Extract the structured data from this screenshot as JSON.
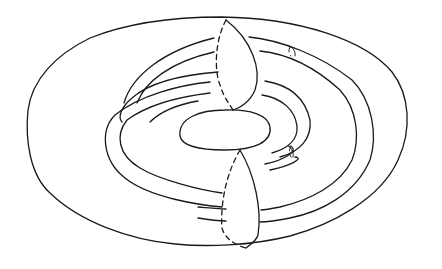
{
  "figure": {
    "title": "",
    "caption": "",
    "stroke_color": "#1a1a1a",
    "background": "#ffffff",
    "elements": {
      "outer_torus": "M 221 17 C 300 18 365 40 392 72 C 410 95 412 130 398 160 C 380 200 330 225 290 236 C 250 246 205 247 175 244 C 130 240 80 222 50 193 C 30 175 25 140 28 110 C 32 80 55 55 90 38 C 125 24 170 17 221 17 Z",
      "inner_hole": "M 180 136 C 178 118 200 110 225 110 C 250 109 268 115 270 127 C 272 142 255 150 225 150 C 200 150 182 146 180 136 Z",
      "meridian_top_front": "M 226 20 C 252 40 262 70 255 90 C 250 102 240 108 233 110",
      "meridian_top_back": "M 226 20 C 215 40 214 70 220 85 C 224 98 230 105 233 110",
      "meridian_bottom_front": "M 240 150 C 255 175 262 210 258 235 C 257 240 250 245 246 248",
      "meridian_bottom_back": "M 240 150 C 228 170 220 200 222 228 C 225 240 238 246 246 248",
      "tube_outer_a": "M 124 103 C 132 75 165 50 214 38 M 249 37 C 280 40 320 55 352 80 C 372 100 378 135 370 160 C 355 195 320 212 290 218 C 275 221 265 222 260 222",
      "tube_outer_b": "M 137 103 C 145 82 170 62 214 52 M 260 51 C 290 54 318 70 340 90 C 358 110 360 140 352 160 C 340 185 310 200 280 207 C 270 209 265 210 261 210",
      "tube_inner_a": "M 210 82 C 180 85 140 95 115 115 C 100 130 102 160 125 178 C 150 198 200 205 222 207",
      "tube_inner_b": "M 210 93 C 185 96 150 103 127 120 C 115 135 118 155 140 168 C 160 180 200 190 222 193",
      "tube_mid_left_a": "M 218 72 C 180 75 150 82 132 98 C 120 108 118 118 122 122",
      "tube_mid_left_b": "M 198 101 C 175 105 160 112 150 122",
      "tube_right_inner_a": "M 265 81 C 290 85 305 98 310 120 C 312 138 300 152 280 157",
      "tube_right_inner_b": "M 262 95 C 282 98 295 110 297 126 C 298 138 290 148 272 153",
      "tube_end_top": "M 289 46 C 293 47 296 52 295 56",
      "tube_end_top_dashed": "M 290 47 C 288 50 289 54 291 56",
      "tube_end_bottom": "M 288 146 C 292 148 294 153 293 157",
      "tube_end_bottom_dashed": "M 291 146 C 289 149 289 153 291 157",
      "right_band_a": "M 265 164 C 285 160 300 150 290 146",
      "right_band_b": "M 270 170 C 290 166 305 158 295 157",
      "bottom_tube_a": "M 198 218 C 210 220 220 221 226 221",
      "bottom_tube_b": "M 198 207 C 210 208 220 209 226 209"
    }
  }
}
